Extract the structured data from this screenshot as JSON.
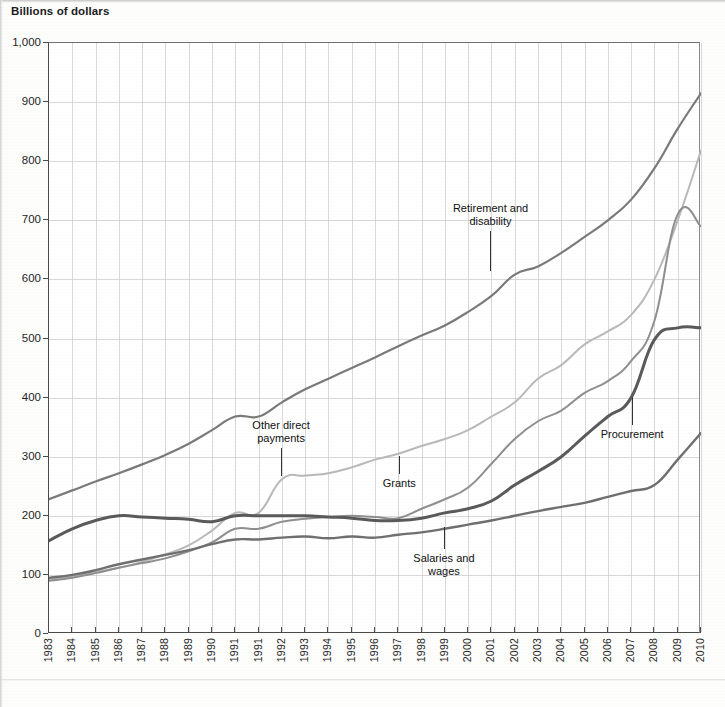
{
  "chart_data": {
    "type": "line",
    "title": "Billions of dollars",
    "xlabel": "",
    "ylabel": "Billions of dollars",
    "ylim": [
      0,
      1000
    ],
    "ytick_labels": [
      "0",
      "100",
      "200",
      "300",
      "400",
      "500",
      "600",
      "700",
      "800",
      "900",
      "1,000"
    ],
    "ytick_values": [
      0,
      100,
      200,
      300,
      400,
      500,
      600,
      700,
      800,
      900,
      1000
    ],
    "grid": true,
    "legend_position": "inline-annotations",
    "categories": [
      "1983",
      "1984",
      "1985",
      "1986",
      "1987",
      "1988",
      "1989",
      "1990",
      "1991",
      "1991",
      "1992",
      "1993",
      "1994",
      "1995",
      "1996",
      "1997",
      "1998",
      "1999",
      "2000",
      "2001",
      "2002",
      "2003",
      "2004",
      "2005",
      "2006",
      "2007",
      "2008",
      "2009",
      "2010"
    ],
    "x_tick_labels": [
      "1983",
      "1984",
      "1985",
      "1986",
      "1987",
      "1988",
      "1989",
      "1990",
      "1991",
      "1991",
      "1992",
      "1993",
      "1994",
      "1995",
      "1996",
      "1997",
      "1998",
      "1999",
      "2000",
      "2001",
      "2002",
      "2003",
      "2004",
      "2005",
      "2006",
      "2007",
      "2008",
      "2009",
      "2010"
    ],
    "series": [
      {
        "name": "Retirement and disability",
        "color": "#7a7a7a",
        "label_text_line1": "Retirement and",
        "label_text_line2": "disability",
        "values": [
          228,
          243,
          258,
          272,
          287,
          303,
          322,
          345,
          368,
          368,
          392,
          414,
          432,
          450,
          468,
          487,
          505,
          522,
          545,
          572,
          608,
          622,
          645,
          672,
          700,
          735,
          788,
          855,
          915
        ]
      },
      {
        "name": "Other direct payments",
        "color": "#b9b9b9",
        "label_text_line1": "Other direct",
        "label_text_line2": "payments",
        "values": [
          92,
          98,
          105,
          112,
          122,
          135,
          150,
          175,
          205,
          205,
          262,
          268,
          272,
          282,
          295,
          305,
          318,
          330,
          345,
          368,
          392,
          432,
          455,
          490,
          512,
          540,
          600,
          700,
          818
        ]
      },
      {
        "name": "Grants",
        "color": "#8f8f8f",
        "label_text_line1": "Grants",
        "label_text_line2": "",
        "values": [
          90,
          95,
          103,
          112,
          120,
          128,
          140,
          155,
          178,
          178,
          190,
          195,
          198,
          200,
          198,
          196,
          212,
          228,
          248,
          288,
          330,
          360,
          378,
          408,
          428,
          462,
          530,
          710,
          690
        ]
      },
      {
        "name": "Procurement",
        "color": "#5a5a5a",
        "label_text_line1": "Procurement",
        "label_text_line2": "",
        "values": [
          158,
          178,
          192,
          200,
          198,
          196,
          194,
          190,
          200,
          200,
          200,
          200,
          198,
          196,
          192,
          192,
          196,
          205,
          212,
          225,
          252,
          275,
          300,
          335,
          368,
          400,
          498,
          518,
          518
        ]
      },
      {
        "name": "Salaries and wages",
        "color": "#6f6f6f",
        "label_text_line1": "Salaries and",
        "label_text_line2": "wages",
        "values": [
          95,
          100,
          108,
          118,
          126,
          134,
          142,
          152,
          160,
          160,
          163,
          165,
          162,
          165,
          163,
          168,
          172,
          178,
          185,
          192,
          200,
          208,
          215,
          222,
          232,
          242,
          252,
          295,
          340
        ]
      }
    ],
    "annotations": [
      {
        "label": "Retirement and disability",
        "anchor_year": "2001",
        "anchor_value": 612
      },
      {
        "label": "Other direct payments",
        "anchor_year": "1992",
        "anchor_value": 265
      },
      {
        "label": "Grants",
        "anchor_year": "1997",
        "anchor_value": 300
      },
      {
        "label": "Procurement",
        "anchor_year": "2007",
        "anchor_value": 400
      },
      {
        "label": "Salaries and wages",
        "anchor_year": "1999",
        "anchor_value": 180
      }
    ]
  }
}
